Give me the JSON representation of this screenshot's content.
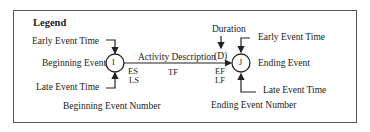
{
  "legend": {
    "title": "Legend",
    "beginning": {
      "early_event_time": "Early  Event Time",
      "event_label": "Beginning Event",
      "late_event_time": "Late Event Time",
      "event_number_label": "Beginning Event Number",
      "node": "I"
    },
    "activity": {
      "description": "Activity Description",
      "duration_label": "Duration",
      "duration_symbol": "(D)",
      "es": "ES",
      "ls": "LS",
      "tf": "TF",
      "ef": "EF",
      "lf": "LF"
    },
    "ending": {
      "early_event_time": "Early  Event Time",
      "event_label": "Ending Event",
      "late_event_time": "Late Event Time",
      "event_number_label": "Ending Event Number",
      "node": "J"
    }
  }
}
